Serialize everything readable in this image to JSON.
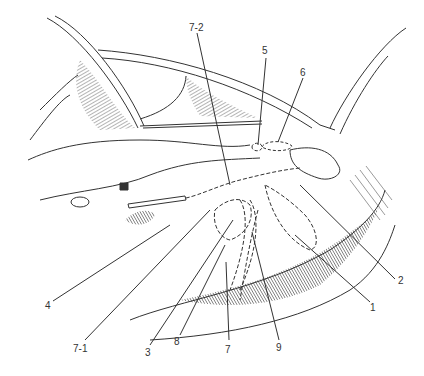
{
  "figure": {
    "type": "anatomical line drawing",
    "colors": {
      "ink": "#333333",
      "background": "#ffffff"
    },
    "labels": [
      {
        "id": "1",
        "text": "1",
        "x": 370,
        "y": 303
      },
      {
        "id": "2",
        "text": "2",
        "x": 398,
        "y": 276
      },
      {
        "id": "3",
        "text": "3",
        "x": 145,
        "y": 348
      },
      {
        "id": "4",
        "text": "4",
        "x": 45,
        "y": 301
      },
      {
        "id": "5",
        "text": "5",
        "x": 262,
        "y": 46
      },
      {
        "id": "6",
        "text": "6",
        "x": 300,
        "y": 68
      },
      {
        "id": "7",
        "text": "7",
        "x": 225,
        "y": 345
      },
      {
        "id": "7-1",
        "text": "7-1",
        "x": 73,
        "y": 344
      },
      {
        "id": "7-2",
        "text": "7-2",
        "x": 189,
        "y": 23
      },
      {
        "id": "8",
        "text": "8",
        "x": 174,
        "y": 337
      },
      {
        "id": "9",
        "text": "9",
        "x": 276,
        "y": 343
      }
    ]
  }
}
